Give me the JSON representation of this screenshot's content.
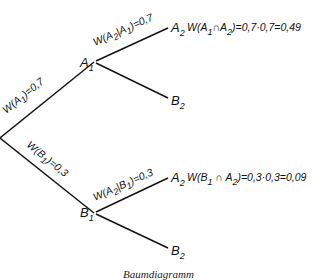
{
  "diagram": {
    "type": "probability-tree",
    "line_color": "#111111",
    "root": {
      "branches": [
        {
          "node": "A1",
          "edge_label": "W(A1)=0,7",
          "children": [
            {
              "node": "A2",
              "edge_label": "W(A2|A1)=0,7",
              "result": "W(A1∩A2)=0,7·0,7=0,49"
            },
            {
              "node": "B2"
            }
          ]
        },
        {
          "node": "B1",
          "edge_label": "W(B1)=0,3",
          "children": [
            {
              "node": "A2",
              "edge_label": "W(A2|B1)=0,3",
              "result": "W(B1∩A2)=0,3·0,3=0,09"
            },
            {
              "node": "B2"
            }
          ]
        }
      ]
    },
    "caption": "Baumdiagramm"
  },
  "labels": {
    "a1": {
      "main": "A",
      "sub": "1"
    },
    "b1": {
      "main": "B",
      "sub": "1"
    },
    "a2_top": {
      "main": "A",
      "sub": "2"
    },
    "b2_top": {
      "main": "B",
      "sub": "2"
    },
    "a2_bottom": {
      "main": "A",
      "sub": "2"
    },
    "b2_bottom": {
      "main": "B",
      "sub": "2"
    },
    "edge_a1": {
      "pre": "W(A",
      "sub": "1",
      "post": ")=0,7"
    },
    "edge_b1": {
      "pre": "W(B",
      "sub": "1",
      "post": ")=0,3"
    },
    "edge_a2_given_a1": {
      "pre": "W(A",
      "sub1": "2",
      "mid": "|A",
      "sub2": "1",
      "post": ")=0,7"
    },
    "edge_a2_given_b1": {
      "pre": "W(A",
      "sub1": "2",
      "mid": "|B",
      "sub2": "1",
      "post": ")=0,3"
    },
    "result_top": {
      "pre": "W(A",
      "sub1": "1",
      "mid": "∩A",
      "sub2": "2",
      "post": ")=0,7·0,7=0,49"
    },
    "result_bottom": {
      "pre": "W(B",
      "sub1": "1",
      "mid": " ∩ A",
      "sub2": "2",
      "post": ")=0,3·0,3=0,09"
    },
    "caption": "Baumdiagramm"
  }
}
